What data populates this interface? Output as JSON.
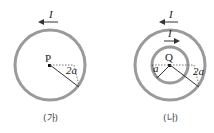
{
  "figures": [
    {
      "caption": "(가)",
      "current_label": "I",
      "current_direction": "counterclockwise",
      "center_label": "P",
      "radius_label": "2a"
    },
    {
      "caption": "(나)",
      "outer_current_label": "I",
      "outer_current_direction": "counterclockwise",
      "inner_current_label": "I",
      "inner_current_direction": "clockwise",
      "center_label": "Q",
      "inner_radius_label": "a",
      "outer_radius_label": "2a"
    }
  ],
  "colors": {
    "ring": "#9a9a9a",
    "line": "#333333"
  }
}
